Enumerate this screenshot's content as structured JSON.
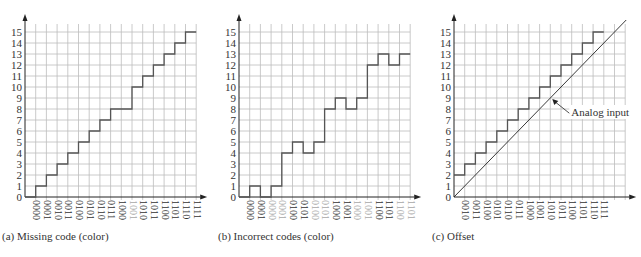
{
  "chart_data": [
    {
      "type": "line",
      "subtype": "staircase",
      "title": "(a) Missing code (color)",
      "origin_x": 25,
      "x": [
        "0000",
        "0001",
        "0010",
        "0011",
        "0100",
        "0101",
        "0110",
        "0111",
        "1000",
        "1001",
        "1010",
        "1011",
        "1100",
        "1101",
        "1110",
        "1111"
      ],
      "values": [
        0,
        1,
        2,
        3,
        4,
        5,
        6,
        7,
        8,
        8,
        10,
        11,
        12,
        13,
        14,
        15
      ],
      "highlight_labels": [
        9
      ],
      "yticks": [
        0,
        1,
        2,
        3,
        4,
        5,
        6,
        7,
        8,
        9,
        10,
        11,
        12,
        13,
        14,
        15
      ],
      "ylim": [
        0,
        15
      ],
      "grid": true
    },
    {
      "type": "line",
      "subtype": "staircase",
      "title": "(b) Incorrect codes (color)",
      "origin_x": 239,
      "x": [
        "0000",
        "0001",
        "0000",
        "0001",
        "0100",
        "0101",
        "0100",
        "0101",
        "1000",
        "1001",
        "1000",
        "1001",
        "1100",
        "1101",
        "1100",
        "1101"
      ],
      "values": [
        0,
        1,
        0,
        1,
        4,
        5,
        4,
        5,
        8,
        9,
        8,
        9,
        12,
        13,
        12,
        13
      ],
      "highlight_labels": [
        2,
        3,
        6,
        7,
        10,
        11,
        14,
        15
      ],
      "yticks": [
        0,
        1,
        2,
        3,
        4,
        5,
        6,
        7,
        8,
        9,
        10,
        11,
        12,
        13,
        14,
        15
      ],
      "ylim": [
        0,
        15
      ],
      "grid": true
    },
    {
      "type": "line",
      "subtype": "staircase",
      "title": "(c) Offset",
      "origin_x": 454,
      "x": [
        "0010",
        "0011",
        "0100",
        "0101",
        "0110",
        "0111",
        "1000",
        "1001",
        "1010",
        "1011",
        "1100",
        "1101",
        "1110",
        "1111"
      ],
      "values": [
        2,
        3,
        4,
        5,
        6,
        7,
        8,
        9,
        10,
        11,
        12,
        13,
        14,
        15
      ],
      "highlight_labels": [],
      "yticks": [
        0,
        1,
        2,
        3,
        4,
        5,
        6,
        7,
        8,
        9,
        10,
        11,
        12,
        13,
        14,
        15
      ],
      "ylim": [
        0,
        15
      ],
      "grid": true,
      "annotation": "Analog input",
      "reference_line": "diagonal analog input from origin"
    }
  ],
  "colors": {
    "grid": "#bdbdbd",
    "axis": "#222222",
    "step": "#555555",
    "label": "#333333",
    "highlight_label": "#a8a8a8"
  }
}
